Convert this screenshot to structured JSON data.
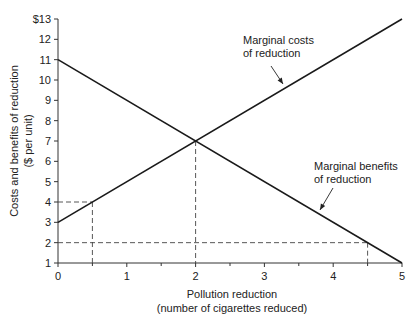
{
  "chart_data": {
    "type": "line",
    "title": "",
    "xlabel": "Pollution reduction",
    "xlabel_sub": "(number of cigarettes reduced)",
    "ylabel": "Costs and benefits of reduction",
    "ylabel_sub": "($ per unit)",
    "xlim": [
      0,
      5
    ],
    "ylim": [
      1,
      13
    ],
    "x_ticks": [
      "0",
      "1",
      "2",
      "3",
      "4",
      "5"
    ],
    "y_ticks": [
      "1",
      "2",
      "3",
      "4",
      "5",
      "6",
      "7",
      "8",
      "9",
      "10",
      "11",
      "12",
      "$13"
    ],
    "grid": false,
    "series": [
      {
        "name": "Marginal costs of reduction",
        "x": [
          0,
          5
        ],
        "y": [
          3,
          13
        ]
      },
      {
        "name": "Marginal benefits of reduction",
        "x": [
          0,
          5
        ],
        "y": [
          11,
          1
        ]
      }
    ],
    "annotations": [
      {
        "label_line1": "Marginal costs",
        "label_line2": "of reduction",
        "points_to": [
          1.8,
          6.6
        ]
      },
      {
        "label_line1": "Marginal benefits",
        "label_line2": "of reduction",
        "points_to": [
          3.3,
          4.2
        ]
      }
    ],
    "reference_lines": [
      {
        "type": "dashed",
        "from": [
          0,
          4
        ],
        "to": [
          0.5,
          4
        ],
        "vertical_to": [
          0.5,
          1
        ]
      },
      {
        "type": "dashed",
        "from": [
          0,
          2
        ],
        "to": [
          4.5,
          2
        ],
        "vertical_to": [
          4.5,
          1
        ]
      },
      {
        "type": "dashed",
        "vertical_from": [
          2,
          7
        ],
        "vertical_to": [
          2,
          1
        ]
      }
    ],
    "intersection": {
      "x": 2,
      "y": 7
    }
  }
}
